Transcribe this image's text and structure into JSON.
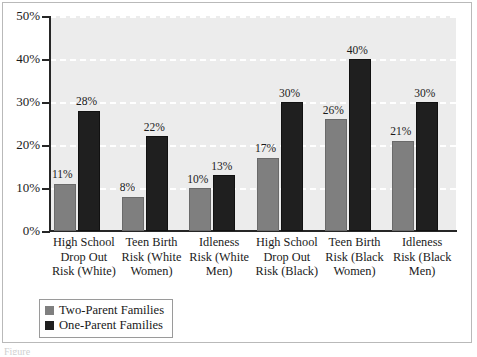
{
  "chart_data": {
    "type": "bar",
    "title": "",
    "xlabel": "",
    "ylabel": "",
    "ylim": [
      0,
      50
    ],
    "ytick_labels": [
      "0%",
      "10%",
      "20%",
      "30%",
      "40%",
      "50%"
    ],
    "ytick_values": [
      0,
      10,
      20,
      30,
      40,
      50
    ],
    "grid": true,
    "legend_position": "bottom-left",
    "value_label_suffix": "%",
    "categories": [
      "High School\nDrop Out\nRisk (White)",
      "Teen Birth\nRisk (White\nWomen)",
      "Idleness\nRisk (White\nMen)",
      "High School\nDrop Out\nRisk (Black)",
      "Teen Birth\nRisk (Black\nWomen)",
      "Idleness\nRisk (Black\nMen)"
    ],
    "series": [
      {
        "name": "Two-Parent Families",
        "color": "#7f7f7f",
        "values": [
          11,
          8,
          10,
          17,
          26,
          21
        ],
        "labels": [
          "11%",
          "8%",
          "10%",
          "17%",
          "26%",
          "21%"
        ]
      },
      {
        "name": "One-Parent Families",
        "color": "#1f1f1f",
        "values": [
          28,
          22,
          13,
          30,
          40,
          30
        ],
        "labels": [
          "28%",
          "22%",
          "13%",
          "30%",
          "40%",
          "30%"
        ]
      }
    ]
  },
  "legend": {
    "items": [
      {
        "label": "Two-Parent Families",
        "color": "#7f7f7f"
      },
      {
        "label": "One-Parent Families",
        "color": "#1f1f1f"
      }
    ]
  },
  "caption": "Figure"
}
